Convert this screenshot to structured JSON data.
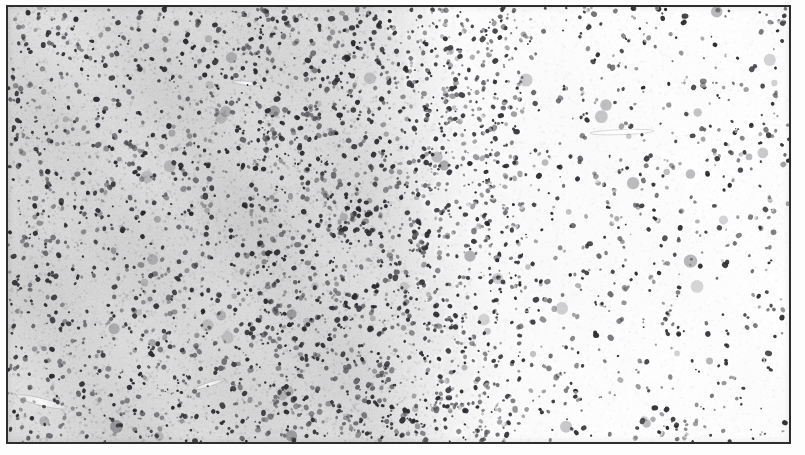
{
  "figure": {
    "kind": "histology-micrograph",
    "modality": "brightfield-light-microscopy",
    "frame": {
      "border_color": "#2e2e2e",
      "border_width_px": 2,
      "page_margin_color": "#ffffff",
      "inner_width_px": 781,
      "inner_height_px": 435,
      "left_px": 6,
      "top_px": 5
    },
    "labels": [],
    "scale_bar": null,
    "annotations": [],
    "caption_text": ""
  },
  "image_content": {
    "description": "Tissue section showing a left-to-right intensity gradient: densely textured gray-stained tissue on the left grading into pale, nearly unstained tissue on the right, with numerous small dark nuclei distributed throughout.",
    "background": {
      "left_tone_hex": "#dcdcdc",
      "mid_tone_hex": "#ededed",
      "right_tone_hex": "#fdfdfd",
      "paper_white_hex": "#ffffff"
    },
    "nuclei": {
      "stain_hex": "#4a4a50",
      "dark_stain_hex": "#2b2b30",
      "halo_hex": "#f5f5f5",
      "min_radius_px": 0.9,
      "max_radius_px": 2.8,
      "left_field_count": 2050,
      "right_field_count": 1150,
      "total_count": 3200
    },
    "gradient": {
      "orientation": "horizontal",
      "transition_start_x_px": 330,
      "transition_end_x_px": 500,
      "tilt_note": "boundary sits slightly left at top and shifts right toward bottom"
    },
    "texture": {
      "neuropil_speckle_count": 9000,
      "fiber_streak_count": 420,
      "fiber_hex": "#b9b9bd"
    },
    "vessels": [
      {
        "name": "vessel-lower-left",
        "x_px": 34,
        "y_px": 404,
        "length_px": 52,
        "angle_deg": 104,
        "width_px": 7
      },
      {
        "name": "vessel-right-upper",
        "x_px": 625,
        "y_px": 128,
        "length_px": 64,
        "angle_deg": 88,
        "width_px": 5
      },
      {
        "name": "vessel-left-mid",
        "x_px": 243,
        "y_px": 78,
        "length_px": 30,
        "angle_deg": 96,
        "width_px": 4
      },
      {
        "name": "vessel-lower-mid",
        "x_px": 205,
        "y_px": 386,
        "length_px": 34,
        "angle_deg": 72,
        "width_px": 4
      }
    ],
    "rng_seed": 20240617
  }
}
